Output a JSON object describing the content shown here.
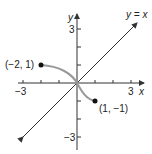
{
  "figure": {
    "x_axis": {
      "label": "x",
      "min_label": "−3",
      "max_label": "3",
      "ticks": [
        -3,
        -2,
        -1,
        1,
        2,
        3
      ]
    },
    "y_axis": {
      "label": "y",
      "min_label": "−3",
      "max_label": "3",
      "ticks": [
        -3,
        -2,
        -1,
        1,
        2,
        3
      ]
    },
    "line": {
      "label": "y = x"
    },
    "curve": {
      "color": "#999999",
      "from": [
        -2,
        1
      ],
      "to": [
        1,
        -1
      ]
    },
    "points": [
      {
        "label": "(−2, 1)",
        "x": -2,
        "y": 1
      },
      {
        "label": "(1, −1)",
        "x": 1,
        "y": -1
      }
    ]
  },
  "colors": {
    "axis": "#333333",
    "curve": "#999999",
    "point": "#111111"
  }
}
